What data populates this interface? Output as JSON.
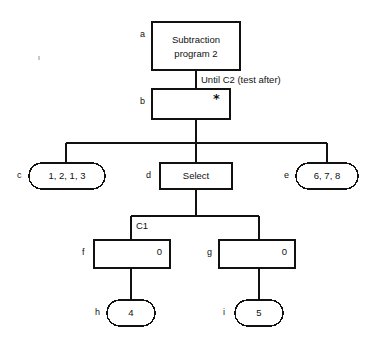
{
  "diagram": {
    "type": "jackson-structure-diagram",
    "stroke_color": "#111111",
    "background_color": "#ffffff",
    "nodes": [
      {
        "id": "a",
        "tag": "a",
        "shape": "rectangle",
        "text_line1": "Subtraction",
        "text_line2": "program 2",
        "marker": ""
      },
      {
        "id": "b",
        "tag": "b",
        "shape": "rectangle",
        "text_line1": "",
        "text_line2": "",
        "marker": "*"
      },
      {
        "id": "c",
        "tag": "c",
        "shape": "rounded",
        "text_line1": "1, 2, 1, 3",
        "text_line2": "",
        "marker": ""
      },
      {
        "id": "d",
        "tag": "d",
        "shape": "rectangle",
        "text_line1": "Select",
        "text_line2": "",
        "marker": ""
      },
      {
        "id": "e",
        "tag": "e",
        "shape": "rounded",
        "text_line1": "6, 7, 8",
        "text_line2": "",
        "marker": ""
      },
      {
        "id": "f",
        "tag": "f",
        "shape": "rectangle",
        "text_line1": "",
        "text_line2": "",
        "marker": "0"
      },
      {
        "id": "g",
        "tag": "g",
        "shape": "rectangle",
        "text_line1": "",
        "text_line2": "",
        "marker": "0"
      },
      {
        "id": "h",
        "tag": "h",
        "shape": "rounded",
        "text_line1": "4",
        "text_line2": "",
        "marker": ""
      },
      {
        "id": "i",
        "tag": "i",
        "shape": "rounded",
        "text_line1": "5",
        "text_line2": "",
        "marker": ""
      }
    ],
    "edge_labels": [
      {
        "id": "until-c2",
        "text": "Until C2 (test after)"
      },
      {
        "id": "c1",
        "text": "C1"
      }
    ]
  }
}
